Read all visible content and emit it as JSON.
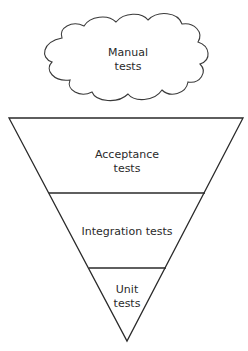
{
  "diagram": {
    "type": "inverted-test-pyramid",
    "cloud": {
      "label_line1": "Manual",
      "label_line2": "tests"
    },
    "layers": [
      {
        "label_line1": "Acceptance",
        "label_line2": "tests"
      },
      {
        "label_line1": "Integration tests"
      },
      {
        "label_line1": "Unit",
        "label_line2": "tests"
      }
    ],
    "colors": {
      "stroke": "#2a2a2a",
      "fill": "#ffffff"
    }
  }
}
